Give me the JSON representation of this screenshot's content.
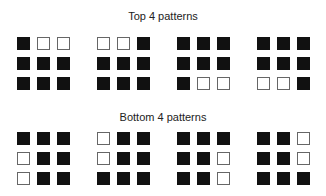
{
  "sections": [
    {
      "title": "Top 4 patterns",
      "patterns": [
        [
          [
            1,
            0,
            0
          ],
          [
            1,
            1,
            1
          ],
          [
            1,
            1,
            1
          ]
        ],
        [
          [
            0,
            0,
            1
          ],
          [
            1,
            1,
            1
          ],
          [
            1,
            1,
            1
          ]
        ],
        [
          [
            1,
            1,
            1
          ],
          [
            1,
            1,
            1
          ],
          [
            1,
            0,
            0
          ]
        ],
        [
          [
            1,
            1,
            1
          ],
          [
            1,
            1,
            1
          ],
          [
            0,
            0,
            1
          ]
        ]
      ]
    },
    {
      "title": "Bottom 4 patterns",
      "patterns": [
        [
          [
            1,
            1,
            1
          ],
          [
            0,
            1,
            1
          ],
          [
            0,
            1,
            1
          ]
        ],
        [
          [
            0,
            1,
            1
          ],
          [
            0,
            1,
            1
          ],
          [
            1,
            1,
            1
          ]
        ],
        [
          [
            1,
            1,
            1
          ],
          [
            1,
            1,
            0
          ],
          [
            1,
            1,
            0
          ]
        ],
        [
          [
            1,
            1,
            0
          ],
          [
            1,
            1,
            0
          ],
          [
            1,
            1,
            1
          ]
        ]
      ]
    }
  ],
  "legend": {
    "filled": "black square = 1",
    "empty": "white square = 0"
  }
}
